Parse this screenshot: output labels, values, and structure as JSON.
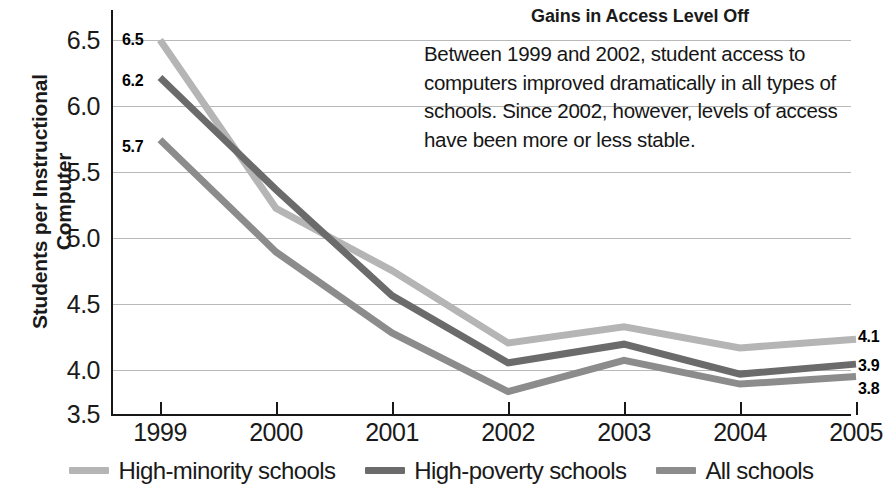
{
  "chart_data": {
    "type": "line",
    "title": "Gains in Access Level Off",
    "annotation": "Between 1999 and 2002, student access to computers improved dramatically in all types of schools. Since 2002, however, levels of access have been more or less stable.",
    "xlabel": "",
    "ylabel": "Students per Instructional\nComputer",
    "categories": [
      "1999",
      "2000",
      "2001",
      "2002",
      "2003",
      "2004",
      "2005"
    ],
    "x": [
      1999,
      2000,
      2001,
      2002,
      2003,
      2004,
      2005
    ],
    "ylim": [
      3.5,
      6.5
    ],
    "ytick_values": [
      6.5,
      6.0,
      5.5,
      5.0,
      4.5,
      4.0,
      3.5
    ],
    "ytick_labels": [
      "6.5",
      "6.0",
      "5.5",
      "5.0",
      "4.5",
      "4.0",
      "3.5"
    ],
    "grid": true,
    "legend_position": "bottom",
    "series": [
      {
        "name": "High-minority schools",
        "color": "#b5b5b5",
        "values": [
          6.5,
          5.15,
          4.65,
          4.07,
          4.2,
          4.03,
          4.1
        ],
        "start_label": "6.5",
        "end_label": "4.1"
      },
      {
        "name": "High-poverty schools",
        "color": "#6b6b6b",
        "values": [
          6.2,
          5.3,
          4.45,
          3.91,
          4.06,
          3.82,
          3.9
        ],
        "start_label": "6.2",
        "end_label": "3.9"
      },
      {
        "name": "All schools",
        "color": "#8c8c8c",
        "values": [
          5.7,
          4.8,
          4.15,
          3.68,
          3.93,
          3.74,
          3.8
        ],
        "start_label": "5.7",
        "end_label": "3.8"
      }
    ]
  },
  "labels": {
    "start": {
      "high_minority": "6.5",
      "high_poverty": "6.2",
      "all_schools": "5.7"
    },
    "end": {
      "high_minority": "4.1",
      "high_poverty": "3.9",
      "all_schools": "3.8"
    }
  },
  "axis": {
    "y_title_line1": "Students per Instructional",
    "y_title_line2": "Computer",
    "y_title": "Students per Instructional\nComputer",
    "y_ticks": [
      "6.5",
      "6.0",
      "5.5",
      "5.0",
      "4.5",
      "4.0",
      "3.5"
    ],
    "x_ticks": [
      "1999",
      "2000",
      "2001",
      "2002",
      "2003",
      "2004",
      "2005"
    ]
  },
  "legend": {
    "items": [
      {
        "label": "High-minority schools",
        "color": "#b5b5b5"
      },
      {
        "label": "High-poverty schools",
        "color": "#6b6b6b"
      },
      {
        "label": "All schools",
        "color": "#8c8c8c"
      }
    ]
  },
  "colors": {
    "high_minority": "#b5b5b5",
    "high_poverty": "#6b6b6b",
    "all_schools": "#8c8c8c",
    "grid": "#b9b9b9",
    "axis": "#171717",
    "text": "#1a1a1a"
  }
}
